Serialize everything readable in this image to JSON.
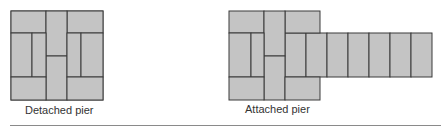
{
  "colors": {
    "brick_fill": "#c4c4c4",
    "mortar_line": "#3a3a3a",
    "caption_text": "#333333",
    "divider": "#8a8a8a"
  },
  "figures": [
    {
      "id": "detached",
      "caption": "Detached pier"
    },
    {
      "id": "attached",
      "caption": "Attached pier"
    }
  ]
}
